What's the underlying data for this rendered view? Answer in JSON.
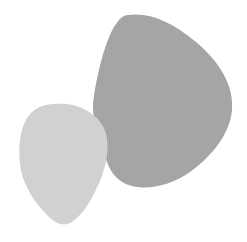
{
  "canvas": {
    "width": 247,
    "height": 242,
    "background": "#ffffff"
  },
  "shapes": [
    {
      "name": "large-blob",
      "fill": "#a8a8a8",
      "texture": "fine-vertical-stripes",
      "layer": "back"
    },
    {
      "name": "small-blob",
      "fill": "#d2d2d2",
      "texture": "fine-vertical-stripes",
      "layer": "front"
    }
  ]
}
